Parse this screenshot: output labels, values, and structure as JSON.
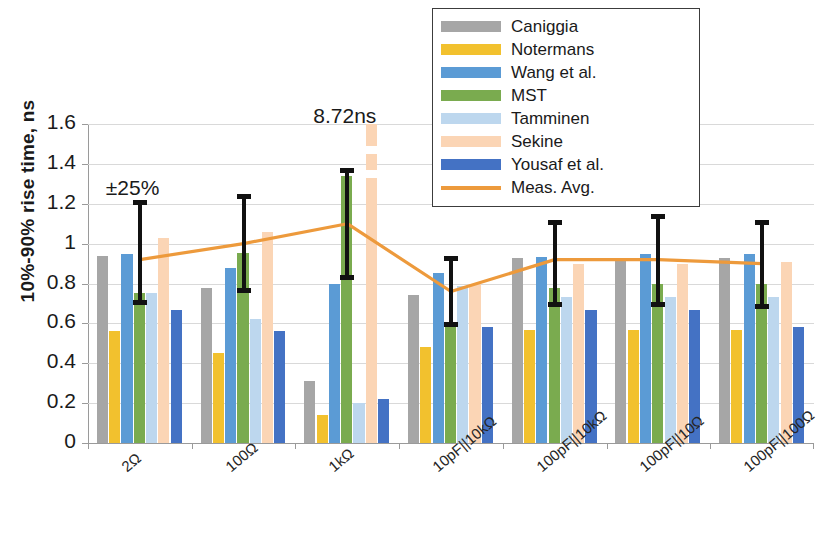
{
  "chart_data": {
    "type": "bar",
    "title": "",
    "xlabel": "",
    "ylabel": "10%-90% rise time, ns",
    "ylim": [
      0,
      1.6
    ],
    "yticks": [
      "0",
      "0.2",
      "0.4",
      "0.6",
      "0.8",
      "1",
      "1.2",
      "1.4",
      "1.6"
    ],
    "grid": true,
    "legend_position": "top-center",
    "categories": [
      "2Ω",
      "100Ω",
      "1kΩ",
      "10pF||10kΩ",
      "100pF||10kΩ",
      "100pF||10Ω",
      "100pF||100Ω"
    ],
    "series": [
      {
        "name": "Caniggia",
        "color": "#a6a6a6",
        "values": [
          0.94,
          0.78,
          0.31,
          0.74,
          0.93,
          0.93,
          0.93
        ]
      },
      {
        "name": "Notermans",
        "color": "#f2c12e",
        "values": [
          0.56,
          0.45,
          0.14,
          0.48,
          0.565,
          0.565,
          0.565
        ]
      },
      {
        "name": "Wang et al.",
        "color": "#5b9bd5",
        "values": [
          0.95,
          0.88,
          0.8,
          0.855,
          0.935,
          0.95,
          0.95
        ]
      },
      {
        "name": "MST",
        "color": "#7aab4f",
        "values": [
          0.75,
          0.955,
          1.34,
          0.59,
          0.78,
          0.8,
          0.8
        ]
      },
      {
        "name": "Tamminen",
        "color": "#bdd7ee",
        "values": [
          0.75,
          0.62,
          0.2,
          0.79,
          0.73,
          0.73,
          0.73
        ]
      },
      {
        "name": "Sekine",
        "color": "#fbd5b5",
        "values": [
          1.03,
          1.06,
          8.72,
          0.8,
          0.9,
          0.9,
          0.91
        ]
      },
      {
        "name": "Yousaf et al.",
        "color": "#4472c4",
        "values": [
          0.665,
          0.56,
          0.22,
          0.58,
          0.665,
          0.665,
          0.58
        ]
      }
    ],
    "line_series": {
      "name": "Meas. Avg.",
      "color": "#ed9a3c",
      "values": [
        0.92,
        1.0,
        1.1,
        0.76,
        0.92,
        0.92,
        0.9
      ]
    },
    "error_bars": [
      {
        "category_index": 0,
        "center": 0.955,
        "low": 0.69,
        "high": 1.22
      },
      {
        "category_index": 1,
        "center": 1.0,
        "low": 0.75,
        "high": 1.25
      },
      {
        "category_index": 2,
        "center": 1.1,
        "low": 0.82,
        "high": 1.38
      },
      {
        "category_index": 3,
        "center": 0.76,
        "low": 0.58,
        "high": 0.94
      },
      {
        "category_index": 4,
        "center": 0.92,
        "low": 0.68,
        "high": 1.12
      },
      {
        "category_index": 5,
        "center": 0.92,
        "low": 0.68,
        "high": 1.15
      },
      {
        "category_index": 6,
        "center": 0.9,
        "low": 0.67,
        "high": 1.12
      }
    ],
    "annotations": [
      {
        "text": "±25%",
        "x_value": 0,
        "y_value": 1.26
      },
      {
        "text": "8.72ns",
        "x_value": 2,
        "y_value": 1.62
      }
    ]
  },
  "legend": {
    "items": [
      {
        "label": "Caniggia",
        "color": "#a6a6a6",
        "kind": "bar"
      },
      {
        "label": "Notermans",
        "color": "#f2c12e",
        "kind": "bar"
      },
      {
        "label": "Wang et al.",
        "color": "#5b9bd5",
        "kind": "bar"
      },
      {
        "label": "MST",
        "color": "#7aab4f",
        "kind": "bar"
      },
      {
        "label": "Tamminen",
        "color": "#bdd7ee",
        "kind": "bar"
      },
      {
        "label": "Sekine",
        "color": "#fbd5b5",
        "kind": "bar"
      },
      {
        "label": "Yousaf et al.",
        "color": "#4472c4",
        "kind": "bar"
      },
      {
        "label": "Meas. Avg.",
        "color": "#ed9a3c",
        "kind": "line"
      }
    ]
  }
}
